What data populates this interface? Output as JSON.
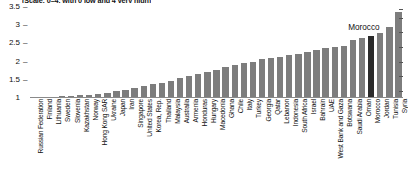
{
  "chart_data": {
    "type": "bar",
    "title": "",
    "subtitle": "(Scale; 0–4, with 0 low and 4 very high)",
    "xlabel": "",
    "ylabel": "",
    "ylim": [
      1,
      3.5
    ],
    "yticks": [
      1,
      1.5,
      2,
      2.5,
      3,
      3.5
    ],
    "ytick_labels": [
      "1",
      "1.5",
      "2",
      "2.5",
      "3",
      "3.5"
    ],
    "grid": false,
    "legend": "none",
    "highlight": "Morocco",
    "highlight_color": "#2b2b2b",
    "bar_color": "#7d7d7d",
    "annotations": [
      {
        "text": "Morocco",
        "target": "Morocco"
      }
    ],
    "categories": [
      "Russian Federation",
      "Finland",
      "Lithuania",
      "Sweden",
      "Slovenia",
      "Kazakhstan",
      "Norway",
      "Hong Kong SAR",
      "Ukraine",
      "Japan",
      "Iran",
      "Singapore",
      "United States",
      "Korea, Rep.",
      "Thailand",
      "Malaysia",
      "Australia",
      "Armenia",
      "Honduras",
      "Hungary",
      "Macedonia",
      "Ghana",
      "Chile",
      "Italy",
      "Turkey",
      "Georgia",
      "Qatar",
      "Lebanon",
      "Indonesia",
      "South Africa",
      "Israel",
      "Bahrain",
      "UAE",
      "West Bank and Gaza",
      "Botswana",
      "Saudi Arabia",
      "Oman",
      "Morocco",
      "Jordan",
      "Tunisia",
      "Syria"
    ],
    "values": [
      1.02,
      1.03,
      1.04,
      1.05,
      1.06,
      1.07,
      1.09,
      1.11,
      1.14,
      1.18,
      1.22,
      1.28,
      1.33,
      1.38,
      1.42,
      1.48,
      1.54,
      1.6,
      1.66,
      1.72,
      1.78,
      1.84,
      1.9,
      1.95,
      2.0,
      2.06,
      2.1,
      2.14,
      2.18,
      2.22,
      2.26,
      2.32,
      2.38,
      2.4,
      2.42,
      2.6,
      2.64,
      2.7,
      2.78,
      2.95,
      3.35
    ]
  }
}
